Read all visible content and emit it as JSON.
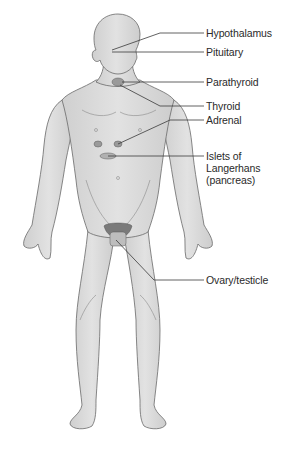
{
  "diagram": {
    "labels": [
      {
        "id": "hypothalamus",
        "text": "Hypothalamus"
      },
      {
        "id": "pituitary",
        "text": "Pituitary"
      },
      {
        "id": "parathyroid",
        "text": "Parathyroid"
      },
      {
        "id": "thyroid",
        "text": "Thyroid"
      },
      {
        "id": "adrenal",
        "text": "Adrenal"
      },
      {
        "id": "islets",
        "text": "Islets of Langerhans (pancreas)"
      },
      {
        "id": "gonads",
        "text": "Ovary/testicle"
      }
    ],
    "colors": {
      "skin": "#dcdcdc",
      "skin_shade": "#c4c4c4",
      "outline": "#6a6a6a",
      "leader_line": "#3a3a3a",
      "gland": "#9a9a9a",
      "text": "#2a2a2a"
    }
  }
}
